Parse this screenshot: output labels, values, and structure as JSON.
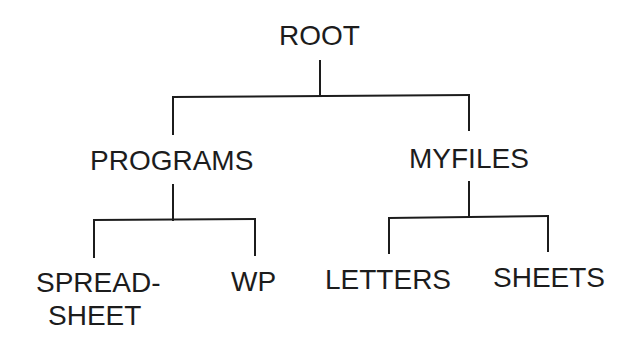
{
  "diagram": {
    "type": "directory-tree",
    "colors": {
      "background": "#ffffff",
      "ink": "#1c1c1c"
    },
    "nodes": {
      "root": {
        "label": "ROOT"
      },
      "programs": {
        "label": "PROGRAMS",
        "parent": "root"
      },
      "myfiles": {
        "label": "MYFILES",
        "parent": "root"
      },
      "spreadsheet": {
        "label_line1": "SPREAD-",
        "label_line2": "SHEET",
        "parent": "programs"
      },
      "wp": {
        "label": "WP",
        "parent": "programs"
      },
      "letters": {
        "label": "LETTERS",
        "parent": "myfiles"
      },
      "sheets": {
        "label": "SHEETS",
        "parent": "myfiles"
      }
    },
    "edges": [
      {
        "from": "root",
        "to": "programs"
      },
      {
        "from": "root",
        "to": "myfiles"
      },
      {
        "from": "programs",
        "to": "spreadsheet"
      },
      {
        "from": "programs",
        "to": "wp"
      },
      {
        "from": "myfiles",
        "to": "letters"
      },
      {
        "from": "myfiles",
        "to": "sheets"
      }
    ]
  }
}
